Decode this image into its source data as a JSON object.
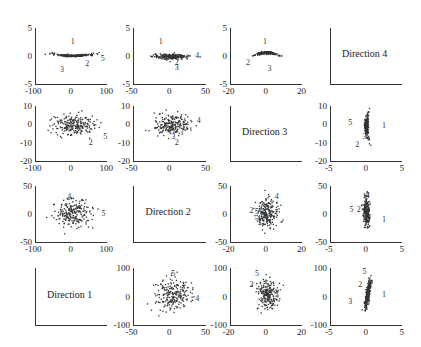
{
  "chart_data": {
    "type": "scatter",
    "title": "",
    "layout": "4x4 scatter plot matrix of projections onto directions 1-4",
    "grid": false,
    "legend": "none",
    "columns_xlim": [
      [
        -100,
        100
      ],
      [
        -50,
        50
      ],
      [
        -20,
        20
      ],
      [
        -5,
        5
      ]
    ],
    "rows_ylim": [
      [
        -5,
        5
      ],
      [
        -20,
        10
      ],
      [
        -50,
        50
      ],
      [
        -100,
        100
      ]
    ],
    "column_xticks": [
      [
        "-100",
        "0",
        "100"
      ],
      [
        "-50",
        "0",
        "50"
      ],
      [
        "-20",
        "0",
        "20"
      ],
      [
        "-5",
        "0",
        "5"
      ]
    ],
    "row_yticks": [
      [
        "5",
        "0",
        "-5"
      ],
      [
        "10",
        "0",
        "-10",
        "-20"
      ],
      [
        "50",
        "0",
        "-50"
      ],
      [
        "100",
        "0",
        "-100"
      ]
    ],
    "diagonal_labels": [
      "Direction 4",
      "Direction 3",
      "Direction 2",
      "Direction 1"
    ],
    "panels": [
      {
        "row": 1,
        "col": 1,
        "xlim": [
          -100,
          100
        ],
        "ylim": [
          -5,
          5
        ],
        "shape": "flat band, slight upward curve at ends",
        "x_spread": [
          -60,
          70
        ],
        "y_spread": [
          -0.5,
          0.8
        ],
        "labeled_points": [
          {
            "label": "1",
            "x": 5,
            "y": 2.5
          },
          {
            "label": "2",
            "x": 45,
            "y": -1.5
          },
          {
            "label": "3",
            "x": -25,
            "y": -2.5
          },
          {
            "label": "5",
            "x": 88,
            "y": -0.5
          }
        ]
      },
      {
        "row": 1,
        "col": 2,
        "xlim": [
          -50,
          50
        ],
        "ylim": [
          -5,
          5
        ],
        "shape": "flat horizontal band",
        "x_spread": [
          -25,
          30
        ],
        "y_spread": [
          -0.5,
          0.5
        ],
        "labeled_points": [
          {
            "label": "1",
            "x": -12,
            "y": 2.5
          },
          {
            "label": "4",
            "x": 38,
            "y": 0
          },
          {
            "label": "2",
            "x": 10,
            "y": -1.2
          },
          {
            "label": "3",
            "x": 10,
            "y": -2.2
          }
        ]
      },
      {
        "row": 1,
        "col": 3,
        "xlim": [
          -20,
          20
        ],
        "ylim": [
          -5,
          5
        ],
        "shape": "arched band",
        "x_spread": [
          -7,
          7
        ],
        "y_spread": [
          -0.5,
          1.0
        ],
        "labeled_points": [
          {
            "label": "1",
            "x": -0.5,
            "y": 2.5
          },
          {
            "label": "2",
            "x": -10,
            "y": -1.2
          },
          {
            "label": "3",
            "x": 2,
            "y": -2.3
          }
        ]
      },
      {
        "row": 1,
        "col": 4,
        "diagonal": true,
        "label": "Direction 4"
      },
      {
        "row": 2,
        "col": 1,
        "xlim": [
          -100,
          100
        ],
        "ylim": [
          -20,
          10
        ],
        "shape": "elliptical cloud",
        "x_spread": [
          -60,
          70
        ],
        "y_spread": [
          -6,
          6
        ],
        "labeled_points": [
          {
            "label": "2",
            "x": 55,
            "y": -10
          },
          {
            "label": "5",
            "x": 95,
            "y": -7
          }
        ]
      },
      {
        "row": 2,
        "col": 2,
        "xlim": [
          -50,
          50
        ],
        "ylim": [
          -20,
          10
        ],
        "shape": "elliptical cloud",
        "x_spread": [
          -25,
          30
        ],
        "y_spread": [
          -6,
          6
        ],
        "labeled_points": [
          {
            "label": "4",
            "x": 40,
            "y": 2
          },
          {
            "label": "3",
            "x": 5,
            "y": -7
          },
          {
            "label": "2",
            "x": 10,
            "y": -10
          }
        ]
      },
      {
        "row": 2,
        "col": 3,
        "diagonal": true,
        "label": "Direction 3"
      },
      {
        "row": 2,
        "col": 4,
        "xlim": [
          -5,
          5
        ],
        "ylim": [
          -20,
          10
        ],
        "shape": "narrow vertical curved band",
        "x_spread": [
          -0.5,
          0.8
        ],
        "y_spread": [
          -8,
          7
        ],
        "labeled_points": [
          {
            "label": "5",
            "x": -2.2,
            "y": 0.5
          },
          {
            "label": "1",
            "x": 2.5,
            "y": -1
          },
          {
            "label": "3",
            "x": -0.2,
            "y": -7
          },
          {
            "label": "2",
            "x": -1.2,
            "y": -11
          }
        ]
      },
      {
        "row": 3,
        "col": 1,
        "xlim": [
          -100,
          100
        ],
        "ylim": [
          -50,
          50
        ],
        "shape": "round cloud",
        "x_spread": [
          -60,
          70
        ],
        "y_spread": [
          -25,
          30
        ],
        "labeled_points": [
          {
            "label": "4",
            "x": -5,
            "y": 30
          },
          {
            "label": "5",
            "x": 90,
            "y": 0
          }
        ]
      },
      {
        "row": 3,
        "col": 2,
        "diagonal": true,
        "label": "Direction 2"
      },
      {
        "row": 3,
        "col": 3,
        "xlim": [
          -20,
          20
        ],
        "ylim": [
          -50,
          50
        ],
        "shape": "vertical elliptical cloud",
        "x_spread": [
          -6,
          7
        ],
        "y_spread": [
          -25,
          30
        ],
        "labeled_points": [
          {
            "label": "4",
            "x": 6,
            "y": 30
          },
          {
            "label": "2",
            "x": -8,
            "y": 5
          },
          {
            "label": "5",
            "x": -5,
            "y": 3
          }
        ]
      },
      {
        "row": 3,
        "col": 4,
        "xlim": [
          -5,
          5
        ],
        "ylim": [
          -50,
          50
        ],
        "shape": "narrow vertical band",
        "x_spread": [
          -0.5,
          0.5
        ],
        "y_spread": [
          -25,
          35
        ],
        "labeled_points": [
          {
            "label": "4",
            "x": 0.2,
            "y": 32
          },
          {
            "label": "5",
            "x": -2,
            "y": 8
          },
          {
            "label": "2",
            "x": -1,
            "y": 8
          },
          {
            "label": "1",
            "x": 2.5,
            "y": -10
          }
        ]
      },
      {
        "row": 4,
        "col": 1,
        "diagonal": true,
        "label": "Direction 1"
      },
      {
        "row": 4,
        "col": 2,
        "xlim": [
          -50,
          50
        ],
        "ylim": [
          -100,
          100
        ],
        "shape": "round cloud",
        "x_spread": [
          -25,
          30
        ],
        "y_spread": [
          -55,
          70
        ],
        "labeled_points": [
          {
            "label": "5",
            "x": 5,
            "y": 80
          },
          {
            "label": "4",
            "x": 38,
            "y": -10
          }
        ]
      },
      {
        "row": 4,
        "col": 3,
        "xlim": [
          -20,
          20
        ],
        "ylim": [
          -100,
          100
        ],
        "shape": "vertical elliptical cloud",
        "x_spread": [
          -6,
          7
        ],
        "y_spread": [
          -55,
          70
        ],
        "labeled_points": [
          {
            "label": "5",
            "x": -5,
            "y": 80
          },
          {
            "label": "2",
            "x": -8,
            "y": 40
          }
        ]
      },
      {
        "row": 4,
        "col": 4,
        "xlim": [
          -5,
          5
        ],
        "ylim": [
          -100,
          100
        ],
        "shape": "narrow slanted band",
        "x_spread": [
          -0.5,
          0.8
        ],
        "y_spread": [
          -55,
          75
        ],
        "labeled_points": [
          {
            "label": "5",
            "x": -0.2,
            "y": 85
          },
          {
            "label": "2",
            "x": -0.8,
            "y": 40
          },
          {
            "label": "1",
            "x": 2.5,
            "y": 5
          },
          {
            "label": "3",
            "x": -2.2,
            "y": -20
          }
        ]
      }
    ]
  },
  "panels_meta": {
    "col_left": [
      35,
      133,
      230,
      330
    ],
    "col_width": [
      72,
      73,
      72,
      72
    ],
    "row_top": [
      28,
      106,
      186,
      268
    ],
    "row_height": [
      56,
      55,
      56,
      57
    ],
    "point_color": "#333333",
    "axis_color": "#333333"
  }
}
